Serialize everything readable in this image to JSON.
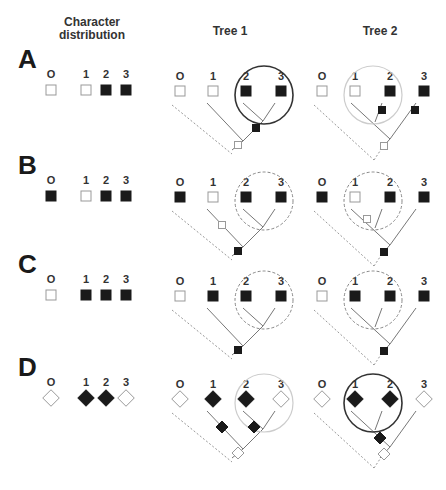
{
  "headers": {
    "character_distribution": "Character\ndistribution",
    "character_line1": "Character",
    "character_line2": "distribution",
    "tree1": "Tree 1",
    "tree2": "Tree 2"
  },
  "taxa_labels": [
    "O",
    "1",
    "2",
    "3"
  ],
  "colors": {
    "filled": "#1a1a1a",
    "empty": "#ffffff",
    "stroke": "#888888",
    "circle_solid": "#333333",
    "circle_light": "#cccccc",
    "circle_dashed": "#888888"
  },
  "rows": [
    {
      "label": "A",
      "shape": "square",
      "states": [
        "empty",
        "empty",
        "filled",
        "filled"
      ],
      "tree1": {
        "topology": "((2,3),1),O",
        "circle": {
          "style": "solid",
          "encloses": [
            "2",
            "3"
          ]
        },
        "changes": [
          {
            "on": "clade-23-stem",
            "state": "filled"
          },
          {
            "on": "root",
            "state": "empty"
          }
        ]
      },
      "tree2": {
        "topology": "((1,2),3),O",
        "circle": {
          "style": "light",
          "encloses": [
            "1",
            "2"
          ]
        },
        "changes": [
          {
            "on": "branch-2",
            "state": "filled"
          },
          {
            "on": "branch-3",
            "state": "filled"
          },
          {
            "on": "root",
            "state": "empty"
          }
        ]
      }
    },
    {
      "label": "B",
      "shape": "square",
      "states": [
        "filled",
        "empty",
        "filled",
        "filled"
      ],
      "tree1": {
        "topology": "((2,3),1),O",
        "circle": {
          "style": "dashed",
          "encloses": [
            "2",
            "3"
          ]
        },
        "changes": [
          {
            "on": "branch-1",
            "state": "empty"
          },
          {
            "on": "root",
            "state": "filled"
          }
        ]
      },
      "tree2": {
        "topology": "((1,2),3),O",
        "circle": {
          "style": "dashed",
          "encloses": [
            "1",
            "2"
          ]
        },
        "changes": [
          {
            "on": "branch-1",
            "state": "empty"
          },
          {
            "on": "root",
            "state": "filled"
          }
        ]
      }
    },
    {
      "label": "C",
      "shape": "square",
      "states": [
        "empty",
        "filled",
        "filled",
        "filled"
      ],
      "tree1": {
        "topology": "((2,3),1),O",
        "circle": {
          "style": "dashed",
          "encloses": [
            "2",
            "3"
          ]
        },
        "changes": [
          {
            "on": "root",
            "state": "filled"
          }
        ]
      },
      "tree2": {
        "topology": "((1,2),3),O",
        "circle": {
          "style": "dashed",
          "encloses": [
            "1",
            "2"
          ]
        },
        "changes": [
          {
            "on": "root",
            "state": "filled"
          }
        ]
      }
    },
    {
      "label": "D",
      "shape": "diamond",
      "states": [
        "empty",
        "filled",
        "filled",
        "empty"
      ],
      "tree1": {
        "topology": "((2,3),1),O",
        "circle": {
          "style": "light",
          "encloses": [
            "2",
            "3"
          ]
        },
        "changes": [
          {
            "on": "branch-1",
            "state": "filled"
          },
          {
            "on": "branch-2",
            "state": "filled"
          },
          {
            "on": "root",
            "state": "empty"
          }
        ]
      },
      "tree2": {
        "topology": "((1,2),3),O",
        "circle": {
          "style": "solid",
          "encloses": [
            "1",
            "2"
          ]
        },
        "changes": [
          {
            "on": "clade-12-stem",
            "state": "filled"
          },
          {
            "on": "root",
            "state": "empty"
          }
        ]
      }
    }
  ]
}
